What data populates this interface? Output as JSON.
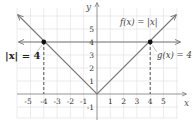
{
  "diagram": {
    "type": "coordinate-graph",
    "axes": {
      "x_label": "x",
      "y_label": "y",
      "x_ticks_negative": [
        "-5",
        "-4",
        "-3",
        "-2",
        "-1"
      ],
      "x_ticks_positive": [
        "1",
        "2",
        "3",
        "4",
        "5"
      ],
      "y_ticks_positive": [
        "1",
        "2",
        "3",
        "4",
        "5"
      ],
      "y_ticks_negative": [
        "-1"
      ],
      "xlim": [
        -5.9,
        6
      ],
      "ylim": [
        -1.8,
        6.5
      ]
    },
    "curves": [
      {
        "name": "f",
        "label": "f(x) = |x|",
        "description": "V-shaped absolute value graph through origin"
      },
      {
        "name": "g",
        "label": "g(x) = 4",
        "description": "Horizontal line at y = 4"
      }
    ],
    "intersections": [
      {
        "x": -4,
        "y": 4
      },
      {
        "x": 4,
        "y": 4
      }
    ],
    "equation_label": "|x| = 4",
    "colors": {
      "grid": "#d9d9d9",
      "axis": "#888888",
      "curve": "#777777",
      "point": "#111111",
      "dash": "#555555"
    }
  }
}
